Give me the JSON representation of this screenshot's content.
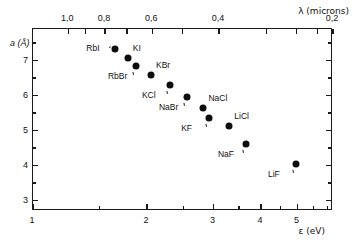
{
  "figure": {
    "background": "#ffffff",
    "marker_color": "#0d0d0d",
    "axis_color": "#1a1a1a"
  },
  "axes": {
    "bottom": {
      "title": "ε (eV)",
      "scale": "log",
      "ticks": [
        "1",
        "2",
        "3",
        "4",
        "5"
      ],
      "range": [
        1,
        6.2
      ]
    },
    "top": {
      "title": "λ (microns)",
      "ticks": [
        "1,0",
        "0,8",
        "0,6",
        "0,4",
        "0,2"
      ],
      "tick_values": [
        1.0,
        0.8,
        0.6,
        0.4,
        0.2
      ]
    },
    "left": {
      "title": "a (Å)",
      "ticks": [
        "7",
        "6",
        "5",
        "4",
        "3"
      ],
      "range": [
        2.7,
        7.9
      ]
    }
  },
  "chart_data": {
    "type": "scatter",
    "title": "",
    "xlabel": "ε (eV)",
    "ylabel": "a (Å)",
    "xlabel_top": "λ (microns)",
    "xscale": "log",
    "xlim": [
      1,
      6.2
    ],
    "ylim": [
      2.7,
      7.9
    ],
    "grid": false,
    "legend": "none",
    "xticks": [
      1,
      2,
      3,
      4,
      5
    ],
    "xticklabels": [
      "1",
      "2",
      "3",
      "4",
      "5"
    ],
    "yticks": [
      7,
      6,
      5,
      4,
      3
    ],
    "yticklabels": [
      "7",
      "6",
      "5",
      "4",
      "3"
    ],
    "top_axis_ticks": [
      1.0,
      0.8,
      0.6,
      0.4,
      0.2
    ],
    "top_axis_ticklabels": [
      "1,0",
      "0,8",
      "0,6",
      "0,4",
      "0,2"
    ],
    "points": [
      {
        "label": "RbI",
        "x": 1.65,
        "y": 7.33,
        "label_pos": "left"
      },
      {
        "label": "KI",
        "x": 1.78,
        "y": 7.07,
        "label_pos": "above-right"
      },
      {
        "label": "RbBr",
        "x": 1.87,
        "y": 6.85,
        "label_pos": "below-left"
      },
      {
        "label": "KBr",
        "x": 2.05,
        "y": 6.6,
        "label_pos": "above-right"
      },
      {
        "label": "KCl",
        "x": 2.3,
        "y": 6.29,
        "label_pos": "below-left"
      },
      {
        "label": "NaBr",
        "x": 2.55,
        "y": 5.97,
        "label_pos": "below-left"
      },
      {
        "label": "NaCl",
        "x": 2.82,
        "y": 5.64,
        "label_pos": "above-right"
      },
      {
        "label": "KF",
        "x": 2.92,
        "y": 5.35,
        "label_pos": "below-left"
      },
      {
        "label": "LiCl",
        "x": 3.3,
        "y": 5.13,
        "label_pos": "above-right"
      },
      {
        "label": "NaF",
        "x": 3.65,
        "y": 4.62,
        "label_pos": "below-left"
      },
      {
        "label": "LiF",
        "x": 4.95,
        "y": 4.03,
        "label_pos": "below-left"
      }
    ]
  }
}
